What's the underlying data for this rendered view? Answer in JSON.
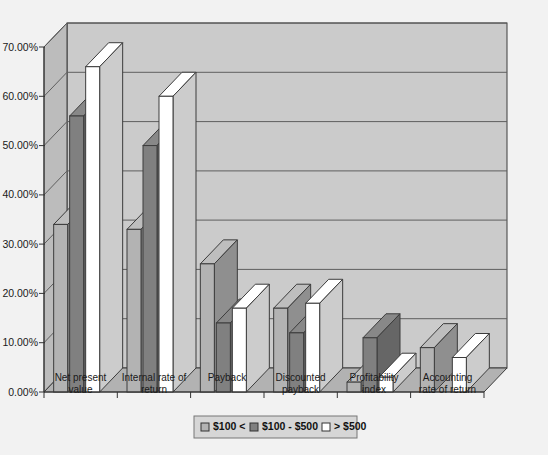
{
  "chart_data": {
    "type": "bar",
    "title": "",
    "xlabel": "",
    "ylabel": "",
    "ylim": [
      0,
      0.75
    ],
    "grid": true,
    "legend_position": "bottom",
    "three_d": true,
    "categories": [
      "Net present value",
      "Internal rate of return",
      "Payback",
      "Discounted payback",
      "Profitability index",
      "Accounting rate of return"
    ],
    "ytick_labels": [
      "0.00%",
      "10.00%",
      "20.00%",
      "30.00%",
      "40.00%",
      "50.00%",
      "60.00%",
      "70.00%"
    ],
    "ytick_values": [
      0,
      0.1,
      0.2,
      0.3,
      0.4,
      0.5,
      0.6,
      0.7
    ],
    "series": [
      {
        "name": "$100 <",
        "color": "#b3b3b3",
        "values": [
          0.34,
          0.33,
          0.26,
          0.17,
          0.02,
          0.09
        ]
      },
      {
        "name": "$100 - $500",
        "color": "#808080",
        "values": [
          0.56,
          0.5,
          0.14,
          0.12,
          0.11,
          0.0
        ]
      },
      {
        "name": "> $500",
        "color": "#ffffff",
        "values": [
          0.66,
          0.6,
          0.17,
          0.18,
          0.03,
          0.07
        ]
      }
    ]
  },
  "legend": {
    "items": [
      {
        "label": "$100 <",
        "swatch": "#b3b3b3"
      },
      {
        "label": "$100 - $500",
        "swatch": "#808080"
      },
      {
        "label": "> $500",
        "swatch": "#ffffff"
      }
    ]
  },
  "colors": {
    "page_background": "#f2f2f2",
    "plot_wall": "#cccccc",
    "plot_side_wall": "#bfbfbf",
    "plot_floor": "#b5b5b5",
    "gridline": "#6b6b6b",
    "axis_line": "#333333",
    "series_light": "#b3b3b3",
    "series_dark": "#808080",
    "series_white": "#ffffff",
    "bar_outline": "#3c3c3c",
    "legend_border": "#777777",
    "legend_background": "#d6d6d6"
  }
}
